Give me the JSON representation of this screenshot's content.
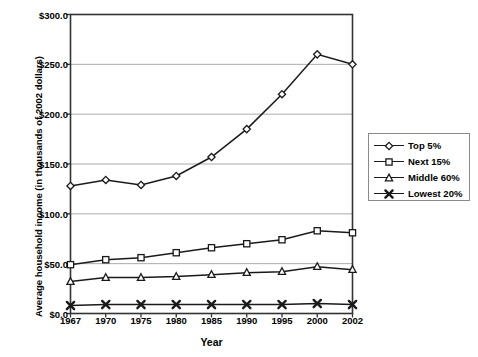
{
  "chart_data": {
    "type": "line",
    "title": "",
    "xlabel": "Year",
    "ylabel": "Average household income (in thousands of 2002 dollars)",
    "categories": [
      "1967",
      "1970",
      "1975",
      "1980",
      "1985",
      "1990",
      "1995",
      "2000",
      "2002"
    ],
    "ylim": [
      0,
      300
    ],
    "yticks": [
      0,
      50,
      100,
      150,
      200,
      250,
      300
    ],
    "ytick_labels": [
      "$0.0",
      "$50.0",
      "$100.0",
      "$150.0",
      "$200.0",
      "$250.0",
      "$300.0"
    ],
    "grid": true,
    "grid_axis": "y",
    "legend_position": "right",
    "series": [
      {
        "name": "Top 5%",
        "marker": "diamond",
        "color": "#1a1a1a",
        "values": [
          128,
          134,
          129,
          138,
          157,
          185,
          220,
          260,
          250
        ]
      },
      {
        "name": "Next 15%",
        "marker": "square",
        "color": "#1a1a1a",
        "values": [
          49,
          54,
          56,
          61,
          66,
          70,
          74,
          83,
          81
        ]
      },
      {
        "name": "Middle 60%",
        "marker": "triangle",
        "color": "#1a1a1a",
        "values": [
          32,
          36,
          36,
          37,
          39,
          41,
          42,
          47,
          44
        ]
      },
      {
        "name": "Lowest 20%",
        "marker": "x",
        "color": "#1a1a1a",
        "values": [
          8,
          9,
          9,
          9,
          9,
          9,
          9,
          10,
          9
        ]
      }
    ]
  },
  "legend": {
    "items": [
      {
        "label": "Top 5%"
      },
      {
        "label": "Next 15%"
      },
      {
        "label": "Middle 60%"
      },
      {
        "label": "Lowest 20%"
      }
    ]
  }
}
